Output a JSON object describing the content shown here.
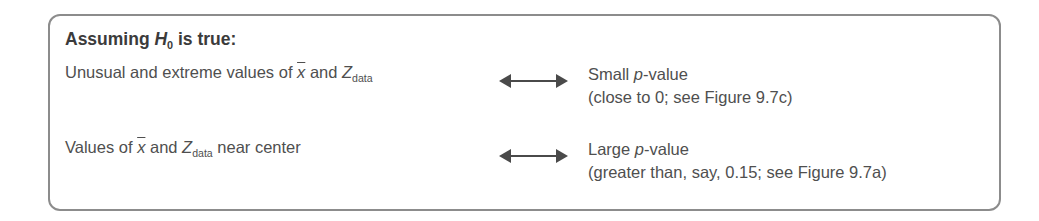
{
  "heading": {
    "prefix": "Assuming ",
    "symbol": "H",
    "subscript": "0",
    "suffix": " is true:"
  },
  "rows": [
    {
      "left": {
        "before_xbar": "Unusual and extreme values of ",
        "xbar": "x",
        "between": " and ",
        "z": "Z",
        "z_sub": "data",
        "after": ""
      },
      "arrow": "double-headed-arrow",
      "right": {
        "line1_prefix": "Small ",
        "line1_italic": "p",
        "line1_suffix": "-value",
        "line2": "(close to 0; see Figure 9.7c)"
      }
    },
    {
      "left": {
        "before_xbar": "Values of ",
        "xbar": "x",
        "between": " and ",
        "z": "Z",
        "z_sub": "data",
        "after": " near center"
      },
      "arrow": "double-headed-arrow",
      "right": {
        "line1_prefix": "Large ",
        "line1_italic": "p",
        "line1_suffix": "-value",
        "line2": "(greater than, say, 0.15; see Figure 9.7a)"
      }
    }
  ],
  "colors": {
    "border": "#8c8c8c",
    "text": "#4f4f4f",
    "heading": "#3b3b3b",
    "arrow": "#4a4a4a"
  }
}
